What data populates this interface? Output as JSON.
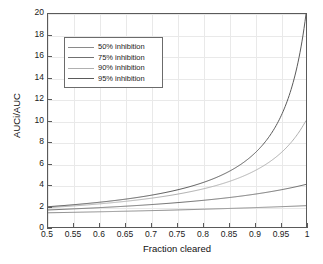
{
  "chart_data": {
    "type": "line",
    "title": "",
    "xlabel": "Fraction cleared",
    "ylabel": "AUCi/AUC",
    "xlim": [
      0.5,
      1
    ],
    "ylim": [
      0,
      20
    ],
    "grid": true,
    "legend_position": "upper-left-inside",
    "xticks": [
      "0.5",
      "0.55",
      "0.6",
      "0.65",
      "0.7",
      "0.75",
      "0.8",
      "0.85",
      "0.9",
      "0.95",
      "1"
    ],
    "xtick_values": [
      0.5,
      0.55,
      0.6,
      0.65,
      0.7,
      0.75,
      0.8,
      0.85,
      0.9,
      0.95,
      1
    ],
    "yticks": [
      "0",
      "2",
      "4",
      "6",
      "8",
      "10",
      "12",
      "14",
      "16",
      "18",
      "20"
    ],
    "ytick_values": [
      0,
      2,
      4,
      6,
      8,
      10,
      12,
      14,
      16,
      18,
      20
    ],
    "x": [
      0.5,
      0.525,
      0.55,
      0.575,
      0.6,
      0.625,
      0.65,
      0.675,
      0.7,
      0.725,
      0.75,
      0.775,
      0.8,
      0.825,
      0.85,
      0.875,
      0.9,
      0.915,
      0.93,
      0.94,
      0.95,
      0.96,
      0.97,
      0.975,
      0.98,
      0.985,
      0.99,
      0.995,
      1
    ],
    "series": [
      {
        "name": "50% inhibition",
        "inhibition": 0.5,
        "color": "#8a8a8a",
        "values": [
          1.33,
          1.36,
          1.38,
          1.41,
          1.43,
          1.45,
          1.48,
          1.51,
          1.54,
          1.57,
          1.6,
          1.63,
          1.67,
          1.71,
          1.74,
          1.78,
          1.82,
          1.85,
          1.87,
          1.89,
          1.9,
          1.92,
          1.94,
          1.95,
          1.96,
          1.97,
          1.98,
          1.99,
          2.0
        ]
      },
      {
        "name": "75% inhibition",
        "inhibition": 0.75,
        "color": "#707070",
        "values": [
          1.6,
          1.64,
          1.68,
          1.73,
          1.78,
          1.83,
          1.88,
          1.94,
          2.0,
          2.07,
          2.13,
          2.21,
          2.29,
          2.37,
          2.46,
          2.56,
          2.67,
          2.74,
          2.82,
          2.87,
          2.92,
          2.98,
          3.03,
          3.06,
          3.09,
          3.12,
          3.15,
          3.17,
          3.2
        ]
      },
      {
        "name": "90% inhibition",
        "inhibition": 0.9,
        "color": "#b0b0b0",
        "values": [
          1.82,
          1.9,
          1.98,
          2.08,
          2.17,
          2.29,
          2.41,
          2.55,
          2.7,
          2.87,
          3.08,
          3.31,
          3.57,
          3.88,
          4.26,
          4.71,
          5.26,
          5.69,
          6.19,
          6.58,
          7.02,
          7.52,
          8.1,
          8.42,
          8.77,
          9.15,
          9.57,
          10.03,
          10.0
        ]
      },
      {
        "name": "95% inhibition",
        "inhibition": 0.95,
        "color": "#5a5a5a",
        "values": [
          1.9,
          2.0,
          2.1,
          2.21,
          2.33,
          2.46,
          2.61,
          2.78,
          2.96,
          3.17,
          3.42,
          3.7,
          4.04,
          4.44,
          4.93,
          5.53,
          6.3,
          6.92,
          7.67,
          8.26,
          8.96,
          9.78,
          10.77,
          11.34,
          11.98,
          12.7,
          13.51,
          14.42,
          20.0
        ]
      }
    ],
    "formula_note": "AUCi/AUC = 1/(1 - f*i)"
  },
  "legend": {
    "entries": [
      {
        "label": "50% inhibition"
      },
      {
        "label": "75% inhibition"
      },
      {
        "label": "90% inhibition"
      },
      {
        "label": "95% inhibition"
      }
    ]
  },
  "axes": {
    "x_title": "Fraction cleared",
    "y_title": "AUCi/AUC"
  },
  "colors": {
    "background": "#ffffff",
    "axis": "#5a5a5a",
    "grid": "#e9e9e9",
    "text": "#111111"
  }
}
